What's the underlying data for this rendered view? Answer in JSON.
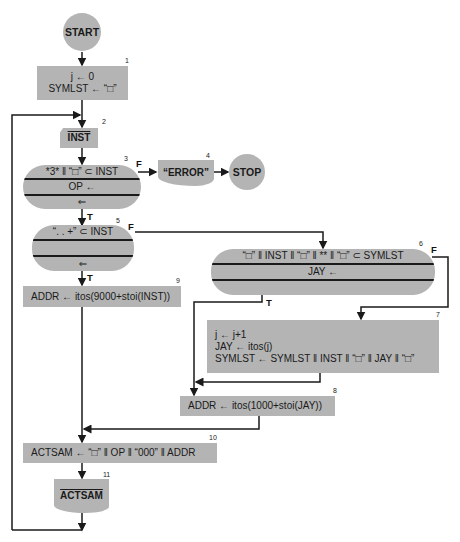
{
  "diagram": {
    "type": "flowchart",
    "start": {
      "label": "START"
    },
    "stop": {
      "label": "STOP"
    },
    "nodes": {
      "n1": {
        "number": "1",
        "lines": [
          "j ← 0",
          "SYMLST ← “□”"
        ]
      },
      "n2": {
        "number": "2",
        "label": "INST"
      },
      "n3": {
        "number": "3",
        "condition": "*3* ‖ “□” ⊂ INST",
        "assign": "OP ←",
        "arrow": "⇐",
        "false_label": "F",
        "true_label": "T"
      },
      "n4": {
        "number": "4",
        "label": "“ERROR”"
      },
      "n5": {
        "number": "5",
        "condition": "“. . +” ⊂ INST",
        "assign": "",
        "arrow": "⇐",
        "false_label": "F",
        "true_label": "T"
      },
      "n6": {
        "number": "6",
        "condition": "“□” ‖ INST ‖ “□” ‖ ** ‖ “□” ⊂ SYMLST",
        "assign": "JAY ←",
        "false_label": "F",
        "true_label": "T"
      },
      "n7": {
        "number": "7",
        "lines": [
          "j ← j+1",
          "JAY ← itos(j)",
          "SYMLST ← SYMLST ‖ INST ‖ “□” ‖ JAY ‖ “□”"
        ]
      },
      "n8": {
        "number": "8",
        "text": "ADDR ← itos(1000+stoi(JAY))"
      },
      "n9": {
        "number": "9",
        "text": "ADDR ← itos(9000+stoi(INST))"
      },
      "n10": {
        "number": "10",
        "text": "ACTSAM ← “□” ‖ OP ‖ “000” ‖ ADDR"
      },
      "n11": {
        "number": "11",
        "label": "ACTSAM"
      }
    },
    "colors": {
      "shape_fill": "#b4b4b4",
      "line": "#1a1a1a",
      "background": "#ffffff"
    }
  }
}
